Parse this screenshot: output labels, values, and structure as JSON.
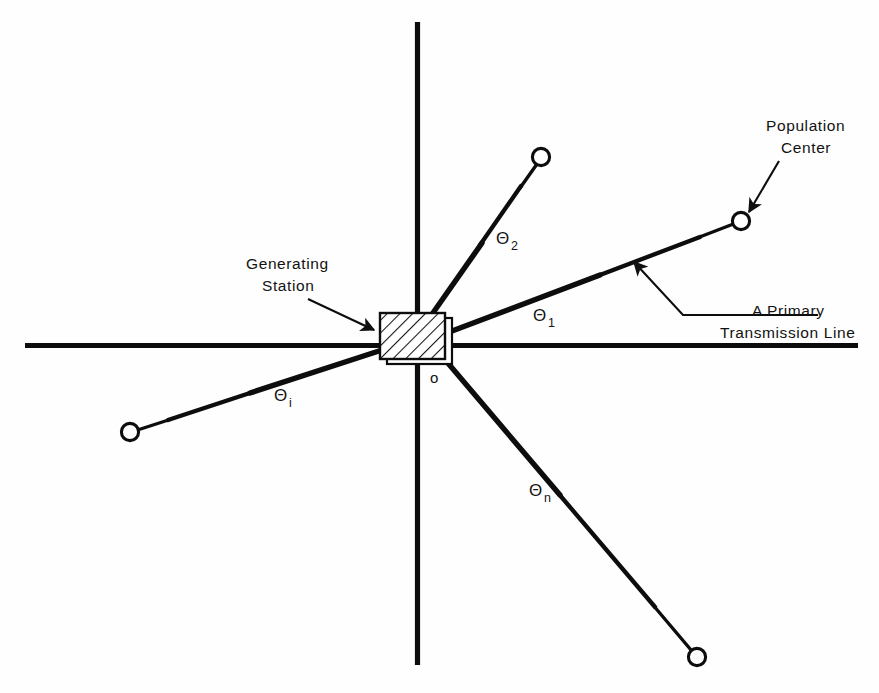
{
  "figure": {
    "background_color": "#fefefe",
    "ink_color": "#0d0d0d"
  },
  "axes": {
    "horizontal": {
      "name": "horizontal-axis",
      "x1": 25,
      "y1": 345,
      "x2": 858,
      "y2": 345
    },
    "vertical": {
      "name": "vertical-axis",
      "x1": 417,
      "y1": 22,
      "x2": 417,
      "y2": 665
    }
  },
  "origin": {
    "label": "o",
    "x": 430,
    "y": 379
  },
  "station": {
    "label_line_1": "Generating",
    "label_line_2": "Station",
    "label_x": 246,
    "label_y": 268,
    "box": {
      "x": 380,
      "y": 313,
      "width": 72,
      "height": 50
    }
  },
  "population_center": {
    "label_line_1": "Population",
    "label_line_2": "Center",
    "label_x": 766,
    "label_y": 130
  },
  "transmission_line_callout": {
    "label_line_1": "A Primary",
    "label_line_2": "Transmission Line",
    "label_x": 752,
    "label_y": 315
  },
  "angles": [
    {
      "symbol": "Θ",
      "subscript": "1",
      "x": 540,
      "y": 320
    },
    {
      "symbol": "Θ",
      "subscript": "2",
      "x": 503,
      "y": 243
    },
    {
      "symbol": "Θ",
      "subscript": "i",
      "x": 281,
      "y": 400
    },
    {
      "symbol": "Θ",
      "subscript": "n",
      "x": 536,
      "y": 495
    }
  ],
  "transmission_lines": [
    {
      "name": "line-1",
      "angle_label": "Θ1",
      "from_x": 452,
      "from_y": 330,
      "to_x": 741,
      "to_y": 221
    },
    {
      "name": "line-2",
      "angle_label": "Θ2",
      "from_x": 430,
      "from_y": 318,
      "to_x": 541,
      "to_y": 157
    },
    {
      "name": "line-i",
      "angle_label": "Θi",
      "from_x": 380,
      "from_y": 350,
      "to_x": 130,
      "to_y": 432
    },
    {
      "name": "line-n",
      "angle_label": "Θn",
      "from_x": 447,
      "from_y": 363,
      "to_x": 697,
      "to_y": 657
    }
  ],
  "population_center_nodes": [
    {
      "name": "node-1",
      "cx": 741,
      "cy": 221,
      "r": 9
    },
    {
      "name": "node-2",
      "cx": 541,
      "cy": 157,
      "r": 9
    },
    {
      "name": "node-i",
      "cx": 130,
      "cy": 432,
      "r": 9
    },
    {
      "name": "node-n",
      "cx": 697,
      "cy": 657,
      "r": 9
    }
  ]
}
